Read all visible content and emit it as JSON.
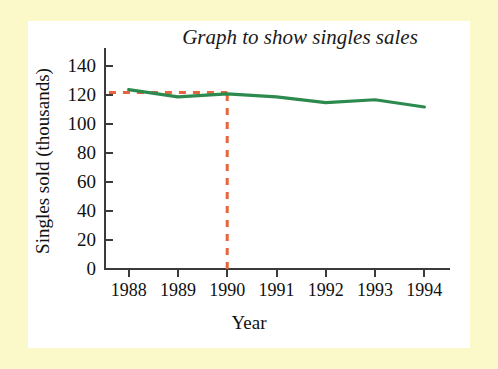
{
  "page": {
    "background_color": "#fbf8c9",
    "panel_color": "#ffffff"
  },
  "chart_data": {
    "type": "line",
    "title": "Graph to show singles sales",
    "xlabel": "Year",
    "ylabel": "Singles sold (thousands)",
    "categories": [
      "1988",
      "1989",
      "1990",
      "1991",
      "1992",
      "1993",
      "1994"
    ],
    "x": [
      1988,
      1989,
      1990,
      1991,
      1992,
      1993,
      1994
    ],
    "values": [
      124,
      119,
      121,
      119,
      115,
      117,
      112
    ],
    "series": [
      {
        "name": "Singles sold",
        "color": "#2d8a4e",
        "values": [
          124,
          119,
          121,
          119,
          115,
          117,
          112
        ]
      }
    ],
    "xlim": [
      1987.5,
      1994.5
    ],
    "ylim": [
      0,
      150
    ],
    "ytick_labels": [
      "0",
      "20",
      "40",
      "60",
      "80",
      "100",
      "120",
      "140"
    ],
    "ytick_values": [
      0,
      20,
      40,
      60,
      80,
      100,
      120,
      140
    ],
    "xtick_labels": [
      "1988",
      "1989",
      "1990",
      "1991",
      "1992",
      "1993",
      "1994"
    ],
    "grid": false,
    "legend": "none",
    "annotations": [
      {
        "name": "construction-line-horizontal",
        "type": "dashed-horizontal",
        "color": "#e8643c",
        "y_value": 122,
        "x_from": 1987.6,
        "x_to": 1990
      },
      {
        "name": "construction-line-vertical",
        "type": "dashed-vertical",
        "color": "#e8643c",
        "x_value": 1990,
        "y_from": 0,
        "y_to": 122
      }
    ],
    "colors": {
      "line": "#2d8a4e",
      "construction": "#e8643c",
      "axis": "#3b3b3b",
      "text": "#111111"
    }
  }
}
